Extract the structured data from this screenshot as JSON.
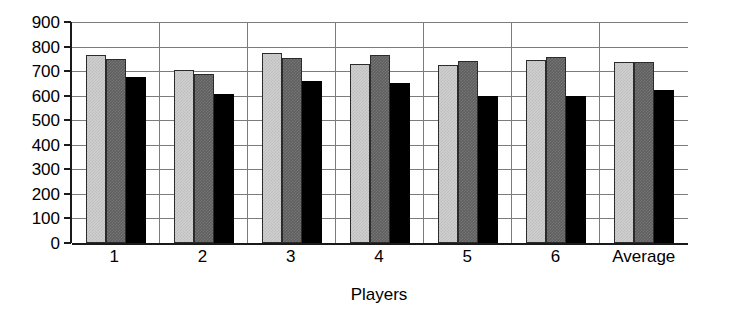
{
  "chart_data": {
    "type": "bar",
    "title": "",
    "xlabel": "Players",
    "ylabel": "",
    "ylim": [
      0,
      900
    ],
    "ystep": 100,
    "grid": true,
    "legend": "none",
    "categories": [
      "1",
      "2",
      "3",
      "4",
      "5",
      "6",
      "Average"
    ],
    "yticks": [
      "900",
      "800",
      "700",
      "600",
      "500",
      "400",
      "300",
      "200",
      "100",
      "0"
    ],
    "series": [
      {
        "name": "series-1",
        "color": "#cfcfcf",
        "values": [
          765,
          705,
          775,
          730,
          725,
          745,
          737
        ]
      },
      {
        "name": "series-2",
        "color": "#5e5e5e",
        "values": [
          748,
          688,
          755,
          765,
          742,
          758,
          737
        ]
      },
      {
        "name": "series-3",
        "color": "#000000",
        "values": [
          675,
          605,
          660,
          650,
          598,
          598,
          625
        ]
      }
    ]
  }
}
